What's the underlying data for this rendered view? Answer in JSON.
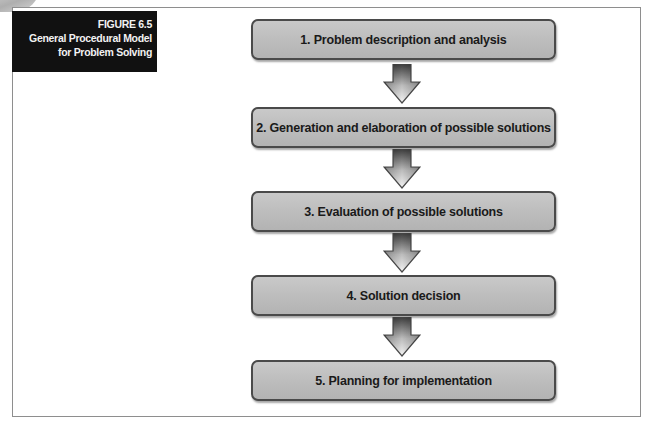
{
  "figure": {
    "number": "FIGURE 6.5",
    "title_line1": "General Procedural Model",
    "title_line2": "for Problem Solving"
  },
  "flow": {
    "direction": "top-to-bottom",
    "connector": "down-arrow",
    "colors": {
      "box_fill": "#bdbdbd",
      "box_border": "#4a4a4a",
      "caption_bg": "#111111",
      "caption_text": "#f2f2f2",
      "frame_border": "#8e8e8e"
    },
    "steps": [
      {
        "label": "1. Problem description and analysis"
      },
      {
        "label": "2. Generation and elaboration of possible solutions"
      },
      {
        "label": "3. Evaluation of possible solutions"
      },
      {
        "label": "4. Solution decision"
      },
      {
        "label": "5. Planning for implementation"
      }
    ]
  }
}
